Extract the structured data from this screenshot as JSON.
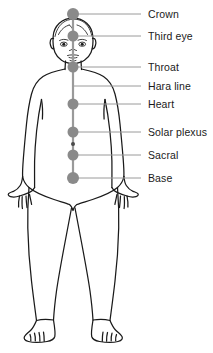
{
  "diagram": {
    "colors": {
      "dot": "#8a8a8a",
      "leader_line": "#9a9a9a",
      "spine_line": "#9a9a9a",
      "body_outline": "#1a1a1a",
      "label_text": "#1a1a1a",
      "background": "#ffffff"
    },
    "spine": {
      "x": 73,
      "top_y": 14,
      "bottom_y": 178
    },
    "points": [
      {
        "id": "crown",
        "label": "Crown",
        "dot": true,
        "dot_radius": 6.0,
        "x": 73,
        "y": 14,
        "line_end_x": 141,
        "label_x": 148,
        "label_y": 9
      },
      {
        "id": "third-eye",
        "label": "Third eye",
        "dot": true,
        "dot_radius": 5.5,
        "x": 73,
        "y": 36,
        "line_end_x": 141,
        "label_x": 148,
        "label_y": 31
      },
      {
        "id": "throat",
        "label": "Throat",
        "dot": true,
        "dot_radius": 5.5,
        "x": 73,
        "y": 67,
        "line_end_x": 141,
        "label_x": 148,
        "label_y": 62
      },
      {
        "id": "hara-line",
        "label": "Hara line",
        "dot": false,
        "dot_radius": 0,
        "x": 73,
        "y": 86,
        "line_end_x": 141,
        "label_x": 148,
        "label_y": 81
      },
      {
        "id": "heart",
        "label": "Heart",
        "dot": true,
        "dot_radius": 5.5,
        "x": 73,
        "y": 104,
        "line_end_x": 141,
        "label_x": 148,
        "label_y": 99
      },
      {
        "id": "solar-plexus",
        "label": "Solar plexus",
        "dot": true,
        "dot_radius": 5.5,
        "x": 73,
        "y": 132,
        "line_end_x": 141,
        "label_x": 148,
        "label_y": 127
      },
      {
        "id": "sacral",
        "label": "Sacral",
        "dot": true,
        "dot_radius": 5.5,
        "x": 73,
        "y": 155,
        "line_end_x": 141,
        "label_x": 148,
        "label_y": 150
      },
      {
        "id": "base",
        "label": "Base",
        "dot": true,
        "dot_radius": 6.0,
        "x": 73,
        "y": 178,
        "line_end_x": 141,
        "label_x": 148,
        "label_y": 173
      }
    ],
    "navel_marker": {
      "id": "navel",
      "x": 73,
      "y": 144,
      "radius": 2
    }
  }
}
